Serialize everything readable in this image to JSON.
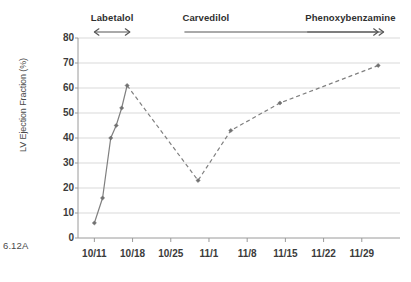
{
  "figure_tag": "6.12A",
  "chart_data": {
    "type": "line",
    "title": "",
    "xlabel": "",
    "ylabel": "LV Ejection Fraction (%)",
    "ylim": [
      0,
      80
    ],
    "ytick_labels": [
      "0",
      "10",
      "20",
      "30",
      "40",
      "50",
      "60",
      "70",
      "80"
    ],
    "ytick_values": [
      0,
      10,
      20,
      30,
      40,
      50,
      60,
      70,
      80
    ],
    "xtick_labels": [
      "10/11",
      "10/18",
      "10/25",
      "11/1",
      "11/8",
      "11/15",
      "11/22",
      "11/29"
    ],
    "xtick_days": [
      0,
      7,
      14,
      21,
      28,
      35,
      42,
      49
    ],
    "xlim_days": [
      -3,
      56
    ],
    "grid": "horizontal",
    "legend": "none",
    "line_color": "#808080",
    "marker": "diamond",
    "series": [
      {
        "name": "LV Ejection Fraction (%)",
        "x_days": [
          0,
          1.5,
          3,
          4,
          5,
          6,
          19,
          25,
          34,
          52
        ],
        "x_labels": [
          "10/11",
          "10/12",
          "10/14",
          "10/15",
          "10/16",
          "10/17",
          "10/30",
          "11/5",
          "11/14",
          "12/2"
        ],
        "values": [
          6,
          16,
          40,
          45,
          52,
          61,
          23,
          43,
          54,
          69
        ],
        "segments": [
          {
            "style": "solid",
            "from_index": 0,
            "to_index": 5
          },
          {
            "style": "dashed",
            "from_index": 5,
            "to_index": 9
          }
        ]
      }
    ],
    "annotations": [
      {
        "label": "Labetalol",
        "arrow": "double",
        "start_day": 0,
        "end_day": 6.5,
        "label_align": "center"
      },
      {
        "label": "Carvedilol",
        "arrow": "right",
        "start_day": 16.5,
        "end_day": 52,
        "label_align": "left"
      },
      {
        "label": "Phenoxybenzamine",
        "arrow": "right",
        "start_day": 39,
        "end_day": 53,
        "label_align": "left"
      }
    ]
  }
}
